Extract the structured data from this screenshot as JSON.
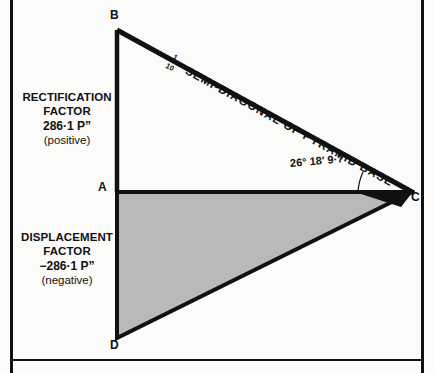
{
  "figure": {
    "background_color": "#fbfbfa",
    "ink_color": "#111111",
    "fill_gray": "#b9b9b9"
  },
  "captions": {
    "rectification": {
      "line1": "RECTIFICATION",
      "line2": "FACTOR",
      "line3": "286·1 P”",
      "line4": "(positive)"
    },
    "displacement": {
      "line1": "DISPLACEMENT",
      "line2": "FACTOR",
      "line3": "−286·1 P”",
      "line4": "(negative)"
    }
  },
  "vertices": {
    "a": "A",
    "b": "B",
    "c": "C",
    "d": "D"
  },
  "annotations": {
    "hypotenuse_fraction_numerator": "1",
    "hypotenuse_fraction_denominator": "10",
    "hypotenuse_label": "SEMI-DIAGONAL OF PYRAMID BASE",
    "angle": "26° 18′ 9·7”"
  },
  "geometry": {
    "point_a": [
      117,
      192
    ],
    "point_b": [
      117,
      30
    ],
    "point_c": [
      412,
      192
    ],
    "point_d": [
      117,
      338
    ],
    "wedge_apex": [
      412,
      192
    ],
    "wedge_top": [
      360,
      192
    ],
    "wedge_bottom": [
      404,
      205
    ]
  }
}
